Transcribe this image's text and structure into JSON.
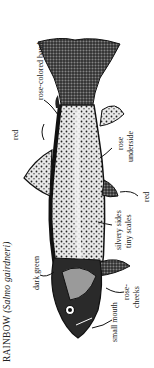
{
  "figure": {
    "title_common": "RAINBOW",
    "title_scientific": "(Salmo gairdneri)",
    "orientation": "rotated 90 degrees, head at bottom, tail at top",
    "labels": {
      "rose_colored_band": "rose-colored band",
      "red_dorsal": "red",
      "dark_green": "dark green",
      "rose_underside": "rose underside",
      "red_ventral": "red",
      "silvery_sides": "silvery sides",
      "tiny_scales": "tiny scales",
      "small_mouth": "small mouth",
      "rose_cheeks_1": "rose-",
      "rose_cheeks_2": "cheeks",
      "rose_underside_1": "rose",
      "rose_underside_2": "underside",
      "silvery_1": "silvery sides",
      "silvery_2": "tiny scales"
    },
    "colors": {
      "ink": "#1a1a1a",
      "paper": "#ffffff"
    }
  }
}
